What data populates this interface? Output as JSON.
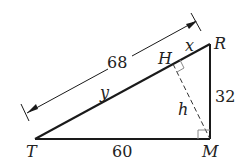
{
  "diagram": {
    "type": "right-triangle-altitude",
    "vertices": {
      "T": "T",
      "M": "M",
      "R": "R",
      "H": "H"
    },
    "labels": {
      "hypotenuse_length": "68",
      "leg_TM": "60",
      "leg_MR": "32",
      "segment_HR": "x",
      "segment_TH": "y",
      "altitude": "h"
    },
    "colors": {
      "line": "#1a1a1a",
      "dashed": "#333333",
      "right_angle_marker": "#888888"
    }
  }
}
